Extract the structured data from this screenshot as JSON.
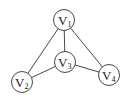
{
  "diagram": {
    "type": "graph",
    "nodes": [
      {
        "id": "V1",
        "letter": "V",
        "sub": "1",
        "x": 64,
        "y": 20
      },
      {
        "id": "V2",
        "letter": "V",
        "sub": "2",
        "x": 22,
        "y": 82
      },
      {
        "id": "V3",
        "letter": "V",
        "sub": "3",
        "x": 65,
        "y": 62
      },
      {
        "id": "V4",
        "letter": "V",
        "sub": "4",
        "x": 109,
        "y": 75
      }
    ],
    "edges": [
      [
        "V1",
        "V2"
      ],
      [
        "V1",
        "V3"
      ],
      [
        "V1",
        "V4"
      ],
      [
        "V2",
        "V3"
      ],
      [
        "V3",
        "V4"
      ]
    ],
    "colors": {
      "stroke": "#333333",
      "background": "#ffffff"
    }
  }
}
